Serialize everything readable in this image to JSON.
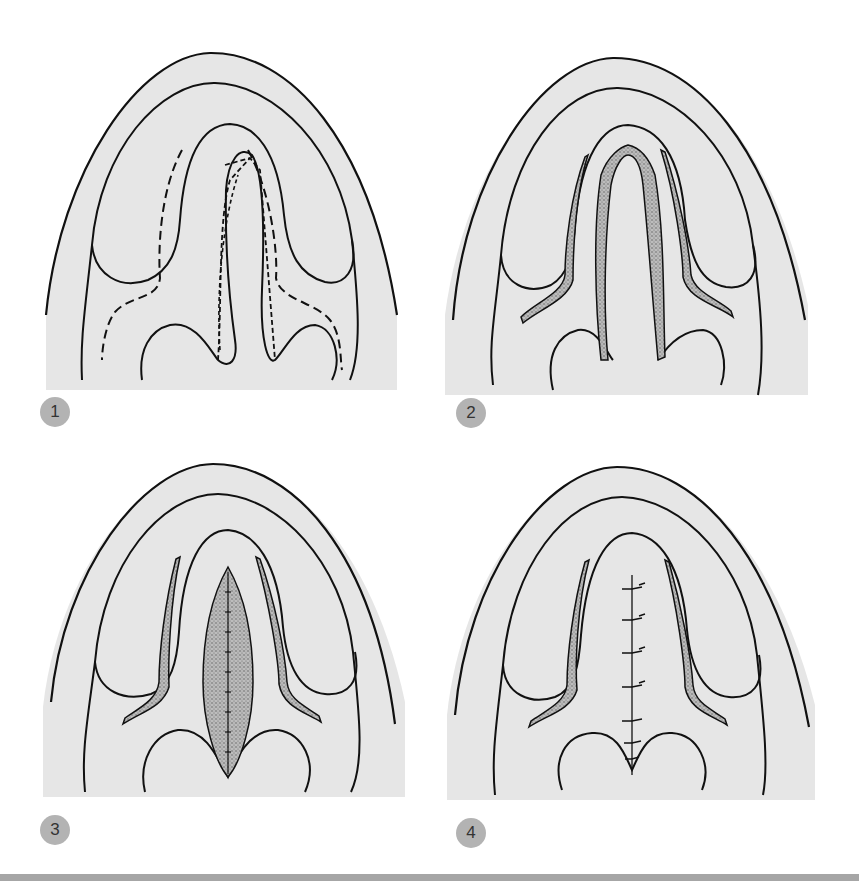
{
  "figure": {
    "panels": [
      {
        "number": "1",
        "label": "Incision lines marked (dashed) along cleft margins and lateral palate"
      },
      {
        "number": "2",
        "label": "Incisions made; mucoperiosteal flaps raised (stippled areas)"
      },
      {
        "number": "3",
        "label": "Flaps mobilized toward midline; nasal layer sutured"
      },
      {
        "number": "4",
        "label": "Oral layer closed in midline with interrupted sutures"
      }
    ],
    "colors": {
      "palate_fill": "#e6e6e6",
      "outline": "#111111",
      "stipple": "#8a8a8a",
      "badge": "#b3b3b3",
      "rule": "#a6a6a6"
    }
  }
}
